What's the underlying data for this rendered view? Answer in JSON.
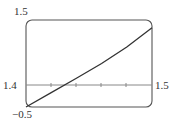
{
  "chart_data": {
    "type": "line",
    "title": "",
    "xlabel": "",
    "ylabel": "",
    "xlim": [
      1.4,
      1.5
    ],
    "ylim": [
      -0.5,
      1.5
    ],
    "grid": false,
    "legend": null,
    "x_axis_at_y": 0,
    "x_tick_count_interior": 4,
    "tick_labels": {
      "y_max": "1.5",
      "y_min": "−0.5",
      "x_min": "1.4",
      "x_max": "1.5"
    },
    "data_provenance": "Values estimated from pixel positions of the plotted curve; no function or formula is shown in the image.",
    "series": [
      {
        "name": "curve",
        "x": [
          1.4,
          1.42,
          1.44,
          1.46,
          1.48,
          1.5
        ],
        "y": [
          -0.5,
          -0.17,
          0.16,
          0.5,
          0.88,
          1.32
        ]
      }
    ],
    "annotations": {
      "axis_crossing_x_approx": 1.433
    }
  },
  "colors": {
    "frame": "#555555",
    "axis": "#888888",
    "curve": "#333333",
    "text": "#333333",
    "background": "#ffffff"
  },
  "labels": {
    "y_max": "1.5",
    "y_min": "−0.5",
    "x_min": "1.4",
    "x_max": "1.5"
  }
}
